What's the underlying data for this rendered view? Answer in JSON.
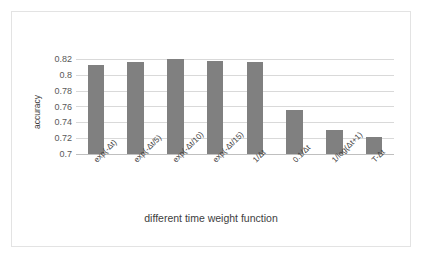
{
  "chart_data": {
    "type": "bar",
    "title": "",
    "xlabel": "different time weight function",
    "ylabel": "accuracy",
    "categories": [
      "exp(-Δt)",
      "exp(-Δt/5)",
      "exp(-Δt/10)",
      "exp(-Δt/15)",
      "1/Δt",
      "0.1/Δt",
      "1/log(Δt+1)",
      "T-Δt"
    ],
    "values": [
      0.812,
      0.816,
      0.82,
      0.817,
      0.816,
      0.755,
      0.73,
      0.721
    ],
    "ylim": [
      0.7,
      0.82
    ],
    "ytick_labels": [
      "0.82",
      "0.8",
      "0.78",
      "0.76",
      "0.74",
      "0.72",
      "0.7"
    ],
    "ytick_values": [
      0.82,
      0.8,
      0.78,
      0.76,
      0.74,
      0.72,
      0.7
    ],
    "grid": true,
    "legend": false,
    "bar_color": "#808080",
    "gridline_color": "#d9d9d9",
    "text_color": "#404040",
    "background": "#ffffff",
    "border_color": "#e3e3e3"
  }
}
